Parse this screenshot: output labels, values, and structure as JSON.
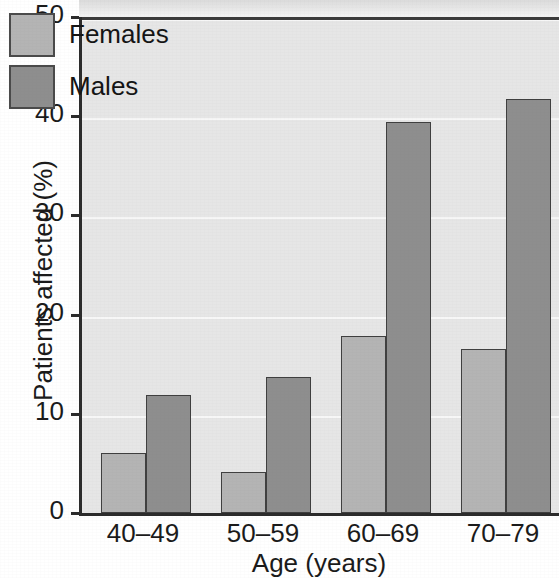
{
  "chart_data": {
    "type": "bar",
    "title": "",
    "xlabel": "Age (years)",
    "ylabel": "Patients affected (%)",
    "categories": [
      "40–49",
      "50–59",
      "60–69",
      "70–79"
    ],
    "series": [
      {
        "name": "Females",
        "color": "#b4b4b4",
        "values": [
          6.0,
          4.1,
          17.8,
          16.5
        ]
      },
      {
        "name": "Males",
        "color": "#8e8e8e",
        "values": [
          11.9,
          13.7,
          39.4,
          41.7
        ]
      }
    ],
    "ylim": [
      0,
      50
    ],
    "yticks": [
      0,
      10,
      20,
      30,
      40,
      50
    ],
    "ytick_labels": [
      "0",
      "10",
      "20",
      "30",
      "40",
      "50"
    ],
    "grid": "horizontal-white-gridlines",
    "legend_position": "top-left-inside",
    "plot_background": "#e6e6e6"
  },
  "axes": {
    "y_title": "Patients affected (%)",
    "x_title": "Age (years)",
    "y_ticks": [
      "50",
      "40",
      "30",
      "20",
      "10",
      "0"
    ],
    "x_ticks": [
      "40–49",
      "50–59",
      "60–69",
      "70–79"
    ]
  },
  "legend": {
    "items": [
      {
        "label": "Females",
        "color": "#b4b4b4"
      },
      {
        "label": "Males",
        "color": "#8e8e8e"
      }
    ]
  }
}
